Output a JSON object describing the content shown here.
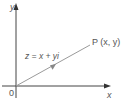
{
  "diagram": {
    "colors": {
      "axis": "#444444",
      "vector": "#9a9a9a",
      "text": "#555555"
    },
    "axes": {
      "y_label": "y",
      "x_label": "x",
      "origin_label": "0"
    },
    "vector": {
      "label": "z = x + yi",
      "point_label": "P (x, y)"
    }
  }
}
